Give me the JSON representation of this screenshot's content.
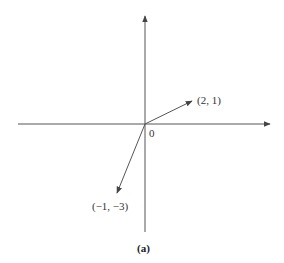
{
  "diagram": {
    "caption": "(a)",
    "origin_label": "0",
    "axes": {
      "x_axis": {
        "from": [
          18,
          124
        ],
        "to": [
          272,
          124
        ]
      },
      "y_axis": {
        "from": [
          145,
          232
        ],
        "to": [
          145,
          14
        ]
      }
    },
    "vectors": [
      {
        "label": "(2, 1)",
        "components": [
          2,
          1
        ],
        "tip": [
          193,
          100
        ]
      },
      {
        "label": "(−1, −3)",
        "components": [
          -1,
          -3
        ],
        "tip": [
          116,
          195
        ]
      }
    ],
    "colors": {
      "stroke": "#555555",
      "text": "#333333",
      "background": "#ffffff"
    }
  }
}
